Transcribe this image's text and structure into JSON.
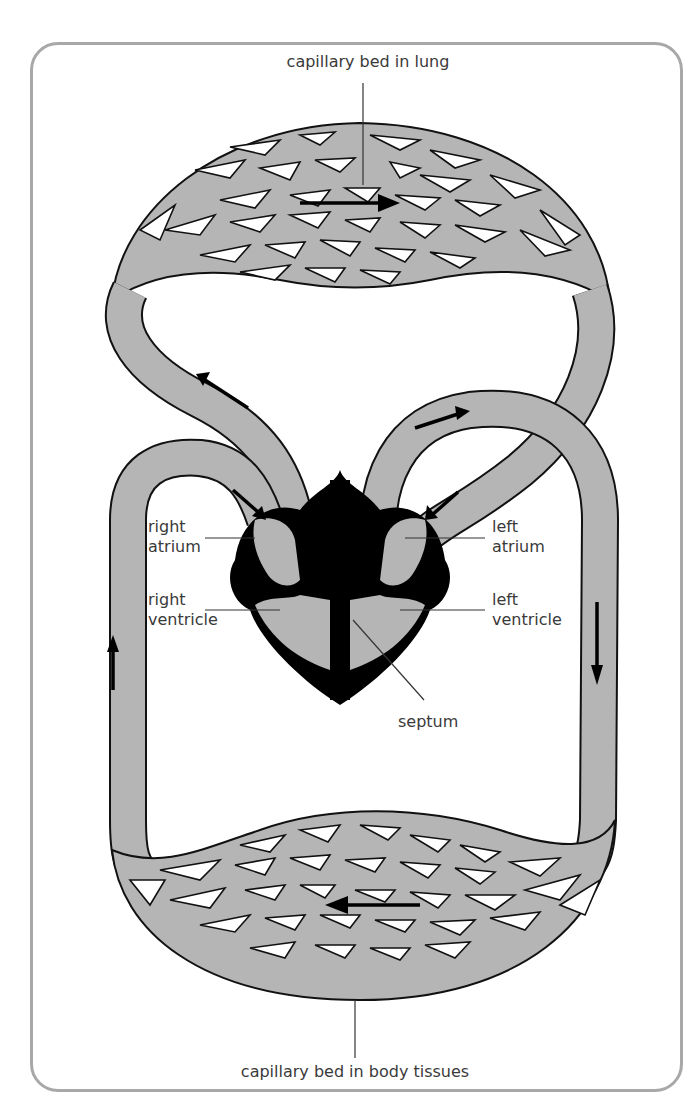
{
  "diagram": {
    "title_visible": false,
    "labels": {
      "lung_bed": "capillary bed in lung",
      "body_bed": "capillary bed in body tissues",
      "right_atrium_1": "right",
      "right_atrium_2": "atrium",
      "right_ventricle_1": "right",
      "right_ventricle_2": "ventricle",
      "left_atrium_1": "left",
      "left_atrium_2": "atrium",
      "left_ventricle_1": "left",
      "left_ventricle_2": "ventricle",
      "septum": "septum"
    },
    "colors": {
      "vessel_fill": "#b5b5b5",
      "heart_muscle": "#000000",
      "frame_border": "#a8a8a8",
      "label_text": "#3a3a3a"
    },
    "flow_arrows": [
      {
        "location": "lung capillary bed",
        "direction": "right"
      },
      {
        "location": "pulmonary vein (left, upper)",
        "direction": "up-left"
      },
      {
        "location": "aorta arch",
        "direction": "right"
      },
      {
        "location": "vena cava into right atrium",
        "direction": "down-right"
      },
      {
        "location": "pulmonary vein into left atrium",
        "direction": "down-left"
      },
      {
        "location": "left vessel (vena cava)",
        "direction": "up"
      },
      {
        "location": "right vessel (aorta descending)",
        "direction": "down"
      },
      {
        "location": "body capillary bed",
        "direction": "left"
      }
    ]
  }
}
